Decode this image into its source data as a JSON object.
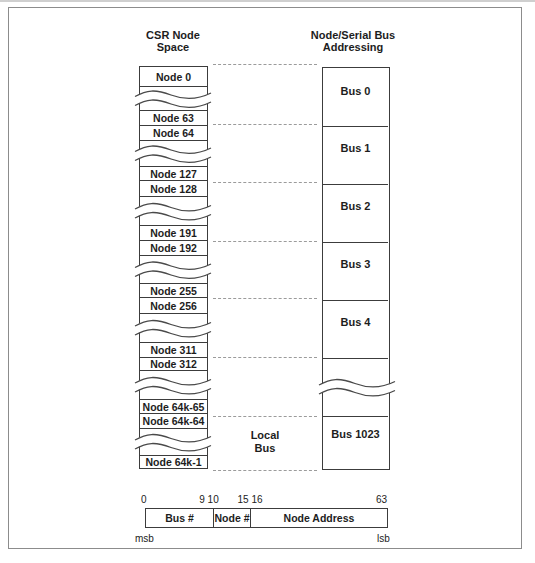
{
  "figure": {
    "left_header": "CSR Node\nSpace",
    "right_header": "Node/Serial Bus\nAddressing",
    "local_bus_label": "Local\nBus"
  },
  "left_column": {
    "nodes": [
      "Node 0",
      "Node 63",
      "Node 64",
      "Node 127",
      "Node 128",
      "Node 191",
      "Node 192",
      "Node 255",
      "Node 256",
      "Node 311",
      "Node 312",
      "Node 64k-65",
      "Node 64k-64",
      "Node 64k-1"
    ]
  },
  "right_column": {
    "buses": [
      "Bus 0",
      "Bus 1",
      "Bus 2",
      "Bus 3",
      "Bus 4",
      "Bus 1023"
    ]
  },
  "register": {
    "bit_labels": [
      "0",
      "9 10",
      "15 16",
      "63"
    ],
    "fields": [
      "Bus #",
      "Node #",
      "Node Address"
    ],
    "msb_label": "msb",
    "lsb_label": "lsb"
  },
  "colors": {
    "line": "#3c3c3c",
    "dashed_line": "#9b9b9b",
    "outer_border": "#8c8c8c",
    "background": "#ffffff"
  }
}
